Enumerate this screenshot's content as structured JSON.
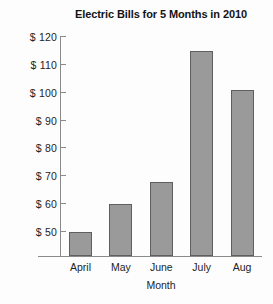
{
  "chart_data": {
    "type": "bar",
    "title": "Electric Bills for 5 Months in 2010",
    "xlabel": "Month",
    "ylabel": "",
    "categories": [
      "April",
      "May",
      "June",
      "July",
      "Aug"
    ],
    "values": [
      50,
      60,
      68,
      115,
      101
    ],
    "ylim": [
      43,
      120
    ],
    "ytick_values": [
      50,
      60,
      70,
      80,
      90,
      100,
      110,
      120
    ],
    "ytick_labels": [
      "$ 50",
      "$ 60",
      "$ 70",
      "$ 80",
      "$ 90",
      "$ 100",
      "$ 110",
      "$ 120"
    ],
    "grid": false,
    "legend": null,
    "bar_color": "#9a9a9a",
    "bar_edge_color": "#5f5f5f",
    "axis_color": "#8a8a8a",
    "background_color": "#fdfdfd",
    "text_color": "#242424"
  }
}
